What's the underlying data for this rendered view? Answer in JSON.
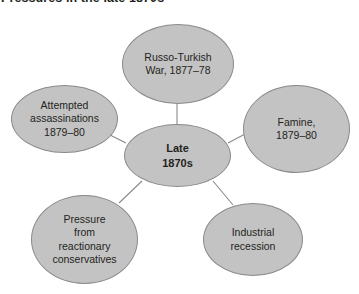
{
  "title": "Pressures in the late 1870s",
  "colors": {
    "node_fill": "#c3c3c3",
    "node_stroke": "#8a8a8a",
    "text": "#231f20",
    "edge": "#8a8a8a",
    "background": "#ffffff"
  },
  "center": {
    "label": "Late\n1870s",
    "line1": "Late",
    "line2": "1870s"
  },
  "nodes": [
    {
      "id": "russo-turkish-war",
      "label": "Russo-Turkish\nWar, 1877–78"
    },
    {
      "id": "famine",
      "label": "Famine,\n1879–80"
    },
    {
      "id": "industrial-recession",
      "label": "Industrial\nrecession"
    },
    {
      "id": "reactionary-pressure",
      "label": "Pressure\nfrom\nreactionary\nconservatives"
    },
    {
      "id": "attempted-assassinations",
      "label": "Attempted\nassassinations\n1879–80"
    }
  ],
  "chart_data": {
    "type": "diagram",
    "diagram_kind": "hub-and-spoke",
    "title": "Pressures in the late 1870s",
    "hub": "Late 1870s",
    "spokes": [
      "Russo-Turkish War, 1877–78",
      "Famine, 1879–80",
      "Industrial recession",
      "Pressure from reactionary conservatives",
      "Attempted assassinations 1879–80"
    ],
    "edges": [
      {
        "from": "Late 1870s",
        "to": "Russo-Turkish War, 1877–78"
      },
      {
        "from": "Late 1870s",
        "to": "Famine, 1879–80"
      },
      {
        "from": "Late 1870s",
        "to": "Industrial recession"
      },
      {
        "from": "Late 1870s",
        "to": "Pressure from reactionary conservatives"
      },
      {
        "from": "Late 1870s",
        "to": "Attempted assassinations 1879–80"
      }
    ]
  }
}
